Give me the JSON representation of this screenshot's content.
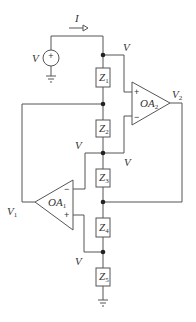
{
  "diagram": {
    "type": "circuit",
    "source": {
      "label": "V",
      "sign": "+"
    },
    "current": {
      "label": "I"
    },
    "impedances": [
      {
        "name": "Z",
        "sub": "1"
      },
      {
        "name": "Z",
        "sub": "2"
      },
      {
        "name": "Z",
        "sub": "3"
      },
      {
        "name": "Z",
        "sub": "4"
      },
      {
        "name": "Z",
        "sub": "5"
      }
    ],
    "opamps": [
      {
        "name": "OA",
        "sub": "1",
        "plus": "+",
        "minus": "−"
      },
      {
        "name": "OA",
        "sub": "2",
        "plus": "+",
        "minus": "−"
      }
    ],
    "node_labels": {
      "v_top": "V",
      "v_mid_left": "V",
      "v_mid_right": "V",
      "v_bottom": "V",
      "v1": {
        "name": "V",
        "sub": "1"
      },
      "v2": {
        "name": "V",
        "sub": "2"
      }
    }
  }
}
